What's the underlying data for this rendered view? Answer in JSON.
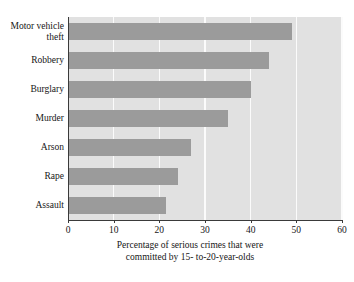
{
  "chart_data": {
    "type": "bar",
    "orientation": "horizontal",
    "title": "",
    "xlabel": "Percentage of serious crimes that were committed by 15- to-20-year-olds",
    "ylabel": "",
    "categories": [
      "Motor vehicle theft",
      "Robbery",
      "Burglary",
      "Murder",
      "Arson",
      "Rape",
      "Assault"
    ],
    "values": [
      49,
      44,
      40,
      35,
      27,
      24,
      21.5
    ],
    "xlim": [
      0,
      60
    ],
    "xticks": [
      0,
      10,
      20,
      30,
      40,
      50,
      60
    ],
    "grid": true,
    "legend": false,
    "bar_color": "#9b9b9b",
    "plot_background": "#e1e1e1",
    "gridline_color": "#fbfbfb"
  },
  "axis": {
    "tick_labels": [
      "0",
      "10",
      "20",
      "30",
      "40",
      "50",
      "60"
    ],
    "title_line1": "Percentage of serious crimes that were",
    "title_line2": "committed by 15- to-20-year-olds"
  },
  "categories_display": [
    {
      "line1": "Motor vehicle",
      "line2": "theft"
    },
    {
      "line1": "Robbery",
      "line2": ""
    },
    {
      "line1": "Burglary",
      "line2": ""
    },
    {
      "line1": "Murder",
      "line2": ""
    },
    {
      "line1": "Arson",
      "line2": ""
    },
    {
      "line1": "Rape",
      "line2": ""
    },
    {
      "line1": "Assault",
      "line2": ""
    }
  ]
}
